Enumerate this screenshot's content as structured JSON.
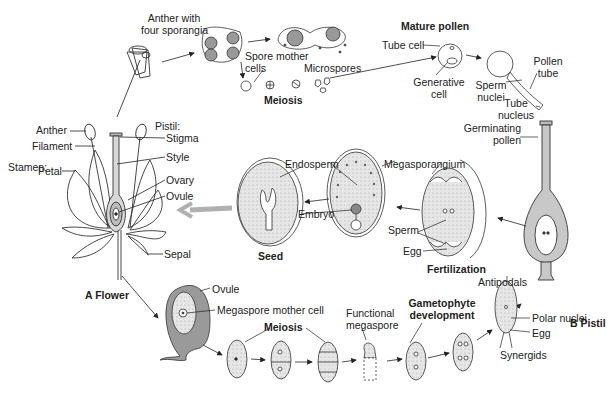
{
  "diagram": {
    "colors": {
      "line": "#222222",
      "shade": "#c8c8c8",
      "gray_arrow": "#b0b0b0",
      "ovule_fill": "#9a9a9a"
    },
    "flower": {
      "section_label_prefix": "A",
      "section_label": "Flower",
      "stamen_heading": "Stamen:",
      "pistil_heading": "Pistil:",
      "parts": [
        "Anther",
        "Filament",
        "Petal",
        "Stigma",
        "Style",
        "Ovary",
        "Ovule",
        "Sepal"
      ]
    },
    "microspore_path": {
      "anther_label_1": "Anther with",
      "anther_label_2": "four sporangia",
      "spore_mother_1": "Spore mother",
      "spore_mother_2": "cells",
      "meiosis": "Meiosis",
      "microspores": "Microspores",
      "mature_pollen": "Mature pollen",
      "tube_cell": "Tube cell",
      "generative_1": "Generative",
      "generative_2": "cell",
      "sperm_nuclei_1": "Sperm",
      "sperm_nuclei_2": "nuclei",
      "pollen_tube_1": "Pollen",
      "pollen_tube_2": "tube",
      "tube_nucleus_1": "Tube",
      "tube_nucleus_2": "nucleus",
      "germinating_1": "Germinating",
      "germinating_2": "pollen"
    },
    "pistil": {
      "section_label_prefix": "B",
      "section_label": "Pistil"
    },
    "fertilization": {
      "heading": "Fertilization",
      "megasporangium": "Megasporangium",
      "sperm": "Sperm",
      "egg": "Egg",
      "endosperm": "Endosperm",
      "embryo": "Embryo",
      "seed": "Seed"
    },
    "megaspore_path": {
      "ovule": "Ovule",
      "megaspore_mother": "Megaspore mother cell",
      "meiosis": "Meiosis",
      "functional_1": "Functional",
      "functional_2": "megaspore",
      "gametophyte_1": "Gametophyte",
      "gametophyte_2": "development",
      "antipodals": "Antipodals",
      "polar_nuclei": "Polar nuclei",
      "egg": "Egg",
      "synergids": "Synergids"
    }
  }
}
